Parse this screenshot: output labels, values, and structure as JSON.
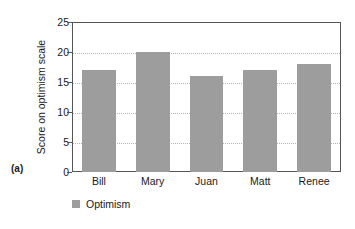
{
  "figure": {
    "panel_label": "(a)"
  },
  "legend": {
    "entries": [
      {
        "label": "Optimism",
        "color": "#9d9d9d"
      }
    ],
    "position": "below-axis-left"
  },
  "chart_data": {
    "type": "bar",
    "title": "",
    "subtitle": "",
    "categories": [
      "Bill",
      "Mary",
      "Juan",
      "Matt",
      "Renee"
    ],
    "values": [
      17,
      20,
      16,
      17,
      18
    ],
    "series": [
      {
        "name": "Optimism",
        "values": [
          17,
          20,
          16,
          17,
          18
        ],
        "color": "#9d9d9d"
      }
    ],
    "xlabel": "",
    "ylabel": "Score on optimism scale",
    "ylim": [
      0,
      25
    ],
    "ytick_values": [
      0,
      5,
      10,
      15,
      20,
      25
    ],
    "ytick_labels": [
      "0",
      "5",
      "10",
      "15",
      "20",
      "25"
    ],
    "ytick_step": 5,
    "grid": "horizontal-dotted",
    "grid_color": "#b4b4b4",
    "axis_color": "#555555",
    "legend_position": "bottom-left",
    "annotations": [
      "(a)"
    ]
  }
}
